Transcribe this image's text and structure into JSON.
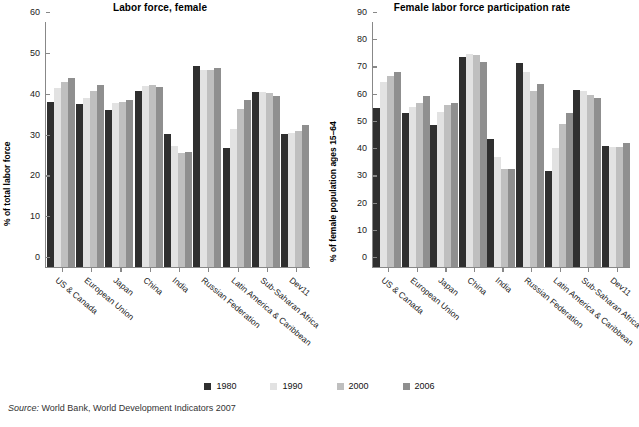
{
  "chart_data": [
    {
      "type": "bar",
      "title": "Labor force, female",
      "xlabel": "",
      "ylabel": "% of total labor force",
      "ylim": [
        0,
        60
      ],
      "yticks": [
        0,
        10,
        20,
        30,
        40,
        50,
        60
      ],
      "grid": false,
      "legend_position": "bottom",
      "categories": [
        "US & Canada",
        "European Union",
        "Japan",
        "China",
        "India",
        "Russian Federation",
        "Latin America & Caribbean",
        "Sub-Saharan Africa",
        "Dev11"
      ],
      "series": [
        {
          "name": "1980",
          "color": "#2f2f2f",
          "values": [
            40.3,
            39.8,
            38.5,
            43.2,
            32.6,
            49.3,
            29.2,
            42.8,
            32.5
          ]
        },
        {
          "name": "1990",
          "color": "#e2e2e2",
          "values": [
            43.8,
            41.4,
            40.2,
            44.4,
            29.7,
            48.2,
            33.9,
            42.8,
            32.9
          ]
        },
        {
          "name": "2000",
          "color": "#bfbfbf",
          "values": [
            45.4,
            43.1,
            40.4,
            44.5,
            27.8,
            48.3,
            38.6,
            42.6,
            33.3
          ]
        },
        {
          "name": "2006",
          "color": "#8f8f8f",
          "values": [
            46.2,
            44.6,
            41.0,
            44.2,
            28.2,
            48.8,
            40.8,
            41.9,
            34.9
          ]
        }
      ]
    },
    {
      "type": "bar",
      "title": "Female labor force participation rate",
      "xlabel": "",
      "ylabel": "% of female population ages 15–64",
      "ylim": [
        0,
        90
      ],
      "yticks": [
        0,
        10,
        20,
        30,
        40,
        50,
        60,
        70,
        80,
        90
      ],
      "grid": false,
      "legend_position": "bottom",
      "categories": [
        "US & Canada",
        "European Union",
        "Japan",
        "China",
        "India",
        "Russian Federation",
        "Latin America & Caribbean",
        "Sub-Saharan Africa",
        "Dev11"
      ],
      "series": [
        {
          "name": "1980",
          "color": "#2f2f2f",
          "values": [
            58.3,
            56.4,
            52.3,
            77.2,
            46.9,
            74.8,
            35.3,
            65.0,
            44.4
          ]
        },
        {
          "name": "1990",
          "color": "#e2e2e2",
          "values": [
            67.8,
            58.8,
            57.0,
            78.4,
            40.3,
            71.7,
            43.6,
            64.6,
            44.1
          ]
        },
        {
          "name": "2000",
          "color": "#bfbfbf",
          "values": [
            70.3,
            60.3,
            59.6,
            78.0,
            36.1,
            64.7,
            52.4,
            63.2,
            44.0
          ]
        },
        {
          "name": "2006",
          "color": "#8f8f8f",
          "values": [
            71.6,
            62.7,
            60.3,
            75.4,
            36.1,
            67.3,
            56.6,
            62.2,
            45.7
          ]
        }
      ]
    }
  ],
  "left_chart": {
    "title": "Labor force, female",
    "ylabel": "% of total labor force"
  },
  "right_chart": {
    "title": "Female labor force participation rate",
    "ylabel": "% of female population ages 15–64"
  },
  "legend": {
    "items": [
      {
        "label": "1980",
        "color": "#2f2f2f"
      },
      {
        "label": "1990",
        "color": "#e2e2e2"
      },
      {
        "label": "2000",
        "color": "#bfbfbf"
      },
      {
        "label": "2006",
        "color": "#8f8f8f"
      }
    ]
  },
  "footer": {
    "source_word": "Source:",
    "source_text": " World Bank, World Development Indicators 2007"
  }
}
